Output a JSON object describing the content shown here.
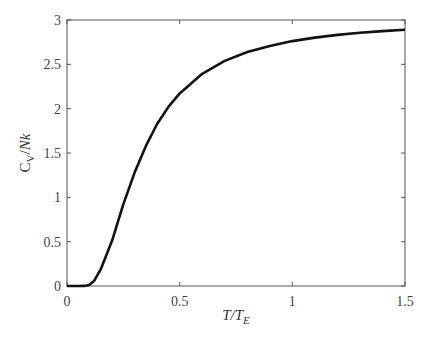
{
  "chart_data": {
    "type": "line",
    "title": "",
    "xlabel": "T/T_E",
    "ylabel": "C_V/Nk",
    "xlim": [
      0,
      1.5
    ],
    "ylim": [
      0,
      3
    ],
    "grid": false,
    "legend": null,
    "xticks": [
      "0",
      "0.5",
      "1",
      "1.5"
    ],
    "yticks": [
      "0",
      "0.5",
      "1",
      "1.5",
      "2",
      "2.5",
      "3"
    ],
    "series": [
      {
        "name": "Einstein solid heat capacity",
        "color": "#111111",
        "x": [
          0,
          0.05,
          0.08,
          0.1,
          0.12,
          0.15,
          0.2,
          0.25,
          0.3,
          0.35,
          0.4,
          0.45,
          0.5,
          0.6,
          0.7,
          0.8,
          0.9,
          1.0,
          1.1,
          1.2,
          1.3,
          1.4,
          1.5
        ],
        "y": [
          0,
          0.0,
          0.0016,
          0.0136,
          0.055,
          0.19,
          0.512,
          0.92,
          1.279,
          1.58,
          1.827,
          2.02,
          2.172,
          2.393,
          2.539,
          2.639,
          2.708,
          2.762,
          2.801,
          2.832,
          2.856,
          2.875,
          2.89
        ]
      }
    ]
  }
}
